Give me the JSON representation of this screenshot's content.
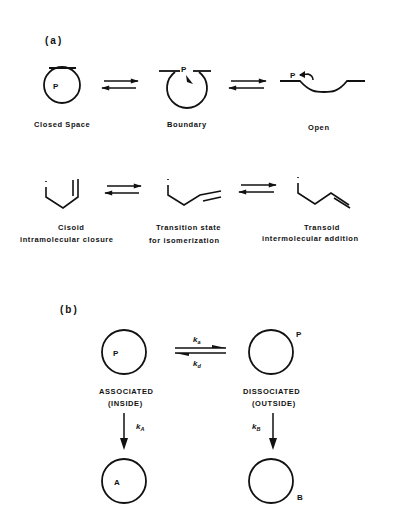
{
  "figure": {
    "panel_a": {
      "label": "(a)",
      "row1": {
        "states": [
          {
            "name": "Closed Space",
            "particle": "P"
          },
          {
            "name": "Boundary",
            "particle": "P"
          },
          {
            "name": "Open",
            "particle": "P"
          }
        ]
      },
      "row2": {
        "states": [
          {
            "line1": "Cisoid",
            "line2": "intramolecular   closure"
          },
          {
            "line1": "Transition   state",
            "line2": "for   isomerization"
          },
          {
            "line1": "Transoid",
            "line2": "intermolecular   addition"
          }
        ]
      }
    },
    "panel_b": {
      "label": "(b)",
      "associated": {
        "particle": "P",
        "line1": "ASSOCIATED",
        "line2": "(INSIDE)"
      },
      "dissociated": {
        "particle": "P",
        "line1": "DISSOCIATED",
        "line2": "(OUTSIDE)"
      },
      "rate_forward": {
        "k": "k",
        "sub": "a"
      },
      "rate_reverse": {
        "k": "k",
        "sub": "d"
      },
      "rate_A": {
        "k": "k",
        "sub": "A"
      },
      "rate_B": {
        "k": "k",
        "sub": "B"
      },
      "product_A": "A",
      "product_B": "B"
    }
  }
}
